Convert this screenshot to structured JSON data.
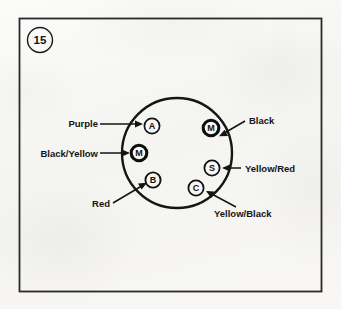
{
  "figure": {
    "number": "15",
    "badge_shape": "circle"
  },
  "frame": {
    "border_color": "#2a2a2a",
    "background_color": "#f7f7f5"
  },
  "diagram": {
    "type": "ignition-switch-terminal-connector",
    "outline_shape": "circle",
    "stroke_color": "#151515",
    "terminals": [
      {
        "id": "A",
        "letter": "A",
        "ring": "thin",
        "cx": 152,
        "cy": 126
      },
      {
        "id": "M-left",
        "letter": "M",
        "ring": "thick",
        "cx": 139,
        "cy": 153
      },
      {
        "id": "B",
        "letter": "B",
        "ring": "thin",
        "cx": 153,
        "cy": 180
      },
      {
        "id": "C",
        "letter": "C",
        "ring": "thin",
        "cx": 196,
        "cy": 188
      },
      {
        "id": "S",
        "letter": "S",
        "ring": "thin",
        "cx": 212,
        "cy": 168
      },
      {
        "id": "M-right",
        "letter": "M",
        "ring": "thick",
        "cx": 211,
        "cy": 128
      }
    ],
    "labels": [
      {
        "id": "purple",
        "text": "Purple",
        "terminal": "A",
        "side": "left",
        "x": 65,
        "y": 127
      },
      {
        "id": "black-yellow",
        "text": "Black/Yellow",
        "terminal": "M-left",
        "side": "left",
        "x": 31,
        "y": 157
      },
      {
        "id": "red",
        "text": "Red",
        "terminal": "B",
        "side": "left",
        "x": 90,
        "y": 205
      },
      {
        "id": "black",
        "text": "Black",
        "terminal": "M-right",
        "side": "right",
        "x": 250,
        "y": 125
      },
      {
        "id": "yellow-red",
        "text": "Yellow/Red",
        "terminal": "S",
        "side": "right",
        "x": 245,
        "y": 171
      },
      {
        "id": "yellow-black",
        "text": "Yellow/Black",
        "terminal": "C",
        "side": "right",
        "x": 215,
        "y": 216
      }
    ]
  }
}
